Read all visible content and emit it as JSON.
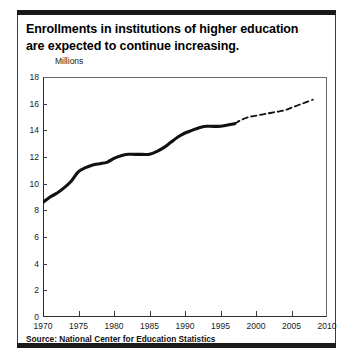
{
  "title": {
    "line1": "Enrollments in institutions of higher education",
    "line2": "are expected to continue increasing."
  },
  "units_label": "Millions",
  "source": "Source: National Center for Education Statistics",
  "colors": {
    "line": "#111111",
    "axis": "#2b2b2b",
    "frame": "#1a1a1a",
    "background": "#ffffff"
  },
  "chart_data": {
    "type": "line",
    "title": "Enrollments in institutions of higher education are expected to continue increasing.",
    "xlabel": "",
    "ylabel": "Millions",
    "xlim": [
      1970,
      2010
    ],
    "ylim": [
      0,
      18
    ],
    "grid": false,
    "legend": "none",
    "xticks": [
      1970,
      1975,
      1980,
      1985,
      1990,
      1995,
      2000,
      2005,
      2010
    ],
    "yticks": [
      0,
      2,
      4,
      6,
      8,
      10,
      12,
      14,
      16,
      18
    ],
    "xtick_labels": [
      "1970",
      "1975",
      "1980",
      "1985",
      "1990",
      "1995",
      "2000",
      "2005",
      "2010"
    ],
    "ytick_labels": [
      "0",
      "2",
      "4",
      "6",
      "8",
      "10",
      "12",
      "14",
      "16",
      "18"
    ],
    "annotations": [
      "Solid line = actual enrollment",
      "Dashed line = projected enrollment"
    ],
    "series": [
      {
        "name": "Actual enrollment",
        "style": "solid",
        "x": [
          1970,
          1971,
          1972,
          1973,
          1974,
          1975,
          1976,
          1977,
          1978,
          1979,
          1980,
          1981,
          1982,
          1983,
          1984,
          1985,
          1986,
          1987,
          1988,
          1989,
          1990,
          1991,
          1992,
          1993,
          1994,
          1995,
          1996,
          1997
        ],
        "values": [
          8.6,
          9.0,
          9.3,
          9.7,
          10.2,
          10.9,
          11.2,
          11.4,
          11.5,
          11.6,
          11.9,
          12.1,
          12.2,
          12.2,
          12.2,
          12.2,
          12.4,
          12.7,
          13.1,
          13.5,
          13.8,
          14.0,
          14.2,
          14.3,
          14.3,
          14.3,
          14.4,
          14.5
        ],
        "color": "#111111"
      },
      {
        "name": "Projected enrollment",
        "style": "dashed",
        "x": [
          1997,
          1998,
          1999,
          2000,
          2001,
          2002,
          2003,
          2004,
          2005,
          2006,
          2007,
          2008
        ],
        "values": [
          14.5,
          14.8,
          15.0,
          15.1,
          15.2,
          15.3,
          15.4,
          15.5,
          15.7,
          15.9,
          16.1,
          16.3
        ],
        "color": "#111111"
      }
    ]
  }
}
